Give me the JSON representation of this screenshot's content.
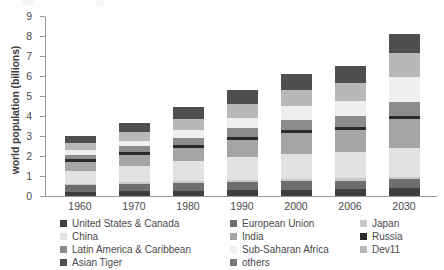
{
  "chart_data": {
    "type": "bar",
    "subtype": "stacked-bar",
    "title": "",
    "xlabel": "",
    "ylabel": "world population (billions)",
    "ylim": [
      0,
      9
    ],
    "yticks": [
      0,
      1,
      2,
      3,
      4,
      5,
      6,
      7,
      8,
      9
    ],
    "grid": false,
    "legend_position": "bottom",
    "categories": [
      "1960",
      "1970",
      "1980",
      "1990",
      "2000",
      "2006",
      "2030"
    ],
    "series": [
      {
        "name": "United States & Canada",
        "color": "#3f3f3f",
        "values": [
          0.2,
          0.23,
          0.25,
          0.28,
          0.31,
          0.33,
          0.4
        ]
      },
      {
        "name": "European Union",
        "color": "#6e6e6e",
        "values": [
          0.33,
          0.36,
          0.38,
          0.4,
          0.42,
          0.43,
          0.43
        ]
      },
      {
        "name": "Japan",
        "color": "#c9c9c9",
        "values": [
          0.09,
          0.1,
          0.12,
          0.12,
          0.13,
          0.13,
          0.12
        ]
      },
      {
        "name": "China",
        "color": "#e2e2e2",
        "values": [
          0.65,
          0.82,
          0.98,
          1.14,
          1.26,
          1.31,
          1.46
        ]
      },
      {
        "name": "India",
        "color": "#a5a5a5",
        "values": [
          0.45,
          0.55,
          0.69,
          0.87,
          1.02,
          1.1,
          1.46
        ]
      },
      {
        "name": "Russia",
        "color": "#2b2b2b",
        "values": [
          0.12,
          0.13,
          0.14,
          0.15,
          0.15,
          0.14,
          0.13
        ]
      },
      {
        "name": "Latin America & Caribbean",
        "color": "#8c8c8c",
        "values": [
          0.22,
          0.29,
          0.36,
          0.44,
          0.52,
          0.56,
          0.7
        ]
      },
      {
        "name": "Sub-Saharan Africa",
        "color": "#efefef",
        "values": [
          0.23,
          0.29,
          0.38,
          0.51,
          0.67,
          0.76,
          1.25
        ]
      },
      {
        "name": "Dev11",
        "color": "#b8b8b8",
        "values": [
          0.35,
          0.43,
          0.54,
          0.68,
          0.82,
          0.9,
          1.2
        ]
      },
      {
        "name": "Asian Tiger",
        "color": "#4f4f4f",
        "values": [
          0.38,
          0.47,
          0.6,
          0.72,
          0.81,
          0.84,
          0.95
        ]
      }
    ],
    "totals": [
      3.02,
      3.67,
      4.44,
      5.31,
      6.11,
      6.5,
      8.1
    ]
  },
  "axis": {
    "y_title": "world population (billions)",
    "y_tick_labels": [
      "0",
      "1",
      "2",
      "3",
      "4",
      "5",
      "6",
      "7",
      "8",
      "9"
    ],
    "x_tick_labels": [
      "1960",
      "1970",
      "1980",
      "1990",
      "2000",
      "2006",
      "2030"
    ]
  },
  "legend": {
    "items": [
      {
        "label": "United States & Canada",
        "color": "#3f3f3f"
      },
      {
        "label": "European Union",
        "color": "#6e6e6e"
      },
      {
        "label": "Japan",
        "color": "#c9c9c9"
      },
      {
        "label": "China",
        "color": "#e2e2e2"
      },
      {
        "label": "India",
        "color": "#a5a5a5"
      },
      {
        "label": "Russia",
        "color": "#2b2b2b"
      },
      {
        "label": "Latin America & Caribbean",
        "color": "#8c8c8c"
      },
      {
        "label": "Sub-Saharan Africa",
        "color": "#efefef"
      },
      {
        "label": "Dev11",
        "color": "#b8b8b8"
      },
      {
        "label": "Asian Tiger",
        "color": "#4f4f4f"
      },
      {
        "label": "others",
        "color": "#787878"
      }
    ]
  }
}
